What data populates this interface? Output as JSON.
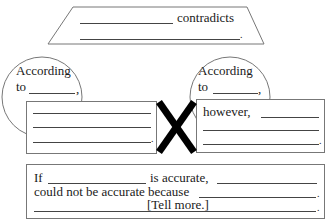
{
  "top_banner": {
    "word": "contradicts",
    "end_punct": "."
  },
  "left_source": {
    "circle_line1": "According",
    "circle_line2": "to",
    "circle_punct": ",",
    "end_punct": "."
  },
  "right_source": {
    "circle_line1": "According",
    "circle_line2": "to",
    "circle_punct": ",",
    "box_start": "however,",
    "end_punct": "."
  },
  "conclusion": {
    "if": "If",
    "is_accurate": "is accurate,",
    "could_not": "could not be accurate because",
    "tell_more": "[Tell more.]",
    "end_punct1": ".",
    "end_punct2": "."
  },
  "colors": {
    "stroke": "#777777",
    "x_mark": "#000000"
  }
}
